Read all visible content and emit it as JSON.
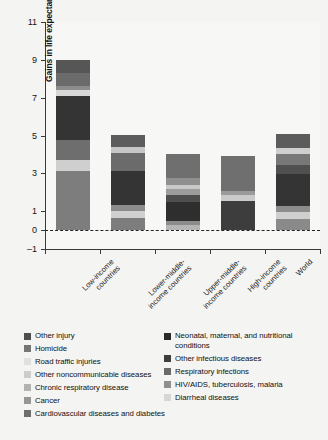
{
  "chart_data": {
    "type": "bar",
    "title": "",
    "subtitle": "",
    "xlabel": "",
    "ylabel": "Gains in life expectancy (years)",
    "ylim": [
      -1,
      11
    ],
    "yticks": [
      -1,
      0,
      1,
      3,
      5,
      7,
      9,
      11
    ],
    "ytick_labels": [
      "–1",
      "0",
      "1",
      "3",
      "5",
      "7",
      "9",
      "11"
    ],
    "grid": false,
    "stacked": true,
    "legend_position": "bottom",
    "zero_reference_line": true,
    "categories": [
      "Low-income countries",
      "Lower-middle-income countries",
      "Upper-middle-income countries",
      "High-income countries",
      "World"
    ],
    "category_labels": [
      [
        "Low-income",
        "countries"
      ],
      [
        "Lower-middle-",
        "income countries"
      ],
      [
        "Upper-middle-",
        "income countries"
      ],
      [
        "High-income",
        "countries"
      ],
      [
        "World"
      ]
    ],
    "series": [
      {
        "name": "Cardiovascular diseases and diabetes",
        "color": "#7d7d7d",
        "values": [
          3.15,
          0.62,
          0.3,
          0.0,
          0.62
        ]
      },
      {
        "name": "Cancer",
        "color": "#9a9a9a",
        "values": [
          0.0,
          0.32,
          0.22,
          0.0,
          0.23
        ]
      },
      {
        "name": "Chronic respiratory disease",
        "color": "#b4b4b4",
        "values": [
          0.0,
          0.1,
          0.1,
          0.0,
          0.1
        ]
      },
      {
        "name": "Other noncommunicable diseases",
        "color": "#cfcfcf",
        "values": [
          0.55,
          0.3,
          0.18,
          0.0,
          0.3
        ]
      },
      {
        "name": "Road traffic injuries",
        "color": "#e2e2e2",
        "values": [
          0.0,
          0.05,
          0.06,
          0.0,
          0.05
        ]
      },
      {
        "name": "Homicide",
        "color": "#6a6a6a",
        "values": [
          0.0,
          0.06,
          0.05,
          0.0,
          0.05
        ]
      },
      {
        "name": "Other injury",
        "color": "#565656",
        "values": [
          0.0,
          0.05,
          0.05,
          0.0,
          0.05
        ]
      },
      {
        "name": "Cardiovascular diseases and diabetes (dark)",
        "color": "#3a3a3a",
        "values": [
          3.2,
          1.72,
          1.05,
          2.1,
          1.7
        ]
      },
      {
        "name": "Other infectious diseases",
        "color": "#2b2b2b",
        "values": [
          0.0,
          0.0,
          0.3,
          0.0,
          0.2
        ]
      },
      {
        "name": "Respiratory infections",
        "color": "#707070",
        "values": [
          0.28,
          0.32,
          0.36,
          0.28,
          0.33
        ]
      },
      {
        "name": "HIV/AIDS, tuberculosis, malaria",
        "color": "#8c8c8c",
        "values": [
          0.22,
          0.22,
          0.22,
          0.22,
          0.22
        ]
      },
      {
        "name": "Diarrheal diseases",
        "color": "#d8d8d8",
        "values": [
          0.3,
          0.18,
          0.18,
          0.18,
          0.2
        ]
      },
      {
        "name": "Neonatal, maternal, and nutritional conditions",
        "color": "#4a4a4a",
        "values": [
          1.32,
          1.08,
          0.93,
          1.15,
          1.05
        ]
      }
    ],
    "totals": [
      9.02,
      5.02,
      4.0,
      3.93,
      5.1
    ]
  },
  "axis": {
    "y_label": "Gains in life expectancy (years)",
    "y_ticks": [
      {
        "value": 11,
        "label": "11"
      },
      {
        "value": 9,
        "label": "9"
      },
      {
        "value": 7,
        "label": "7"
      },
      {
        "value": 5,
        "label": "5"
      },
      {
        "value": 3,
        "label": "3"
      },
      {
        "value": 1,
        "label": "1"
      },
      {
        "value": 0,
        "label": "0"
      },
      {
        "value": -1,
        "label": "–1"
      }
    ]
  },
  "bars": [
    {
      "category": "Low-income countries",
      "label_line1": "Low-income",
      "label_line2": "countries",
      "total": 9.02,
      "segments": [
        {
          "name": "Cardiovascular diseases and diabetes",
          "value": 3.15,
          "color": "#7d7d7d"
        },
        {
          "name": "Other noncommunicable diseases",
          "value": 0.55,
          "color": "#cfcfcf"
        },
        {
          "name": "Cardiovascular + other",
          "value": 1.05,
          "color": "#6e6e6e"
        },
        {
          "name": "Neonatal, maternal, and nutritional conditions",
          "value": 2.35,
          "color": "#343434"
        },
        {
          "name": "Diarrheal diseases",
          "value": 0.3,
          "color": "#d8d8d8"
        },
        {
          "name": "HIV/AIDS, tuberculosis, malaria",
          "value": 0.22,
          "color": "#8c8c8c"
        },
        {
          "name": "Respiratory infections",
          "value": 0.7,
          "color": "#6b6b6b"
        },
        {
          "name": "Other injury",
          "value": 0.7,
          "color": "#565656"
        }
      ]
    },
    {
      "category": "Lower-middle-income countries",
      "label_line1": "Lower-middle-",
      "label_line2": "income countries",
      "total": 5.02,
      "segments": [
        {
          "name": "Cardiovascular diseases and diabetes",
          "value": 0.62,
          "color": "#7d7d7d"
        },
        {
          "name": "Diarrheal diseases",
          "value": 0.38,
          "color": "#d0d0d0"
        },
        {
          "name": "HIV/AIDS, tuberculosis, malaria",
          "value": 0.3,
          "color": "#8c8c8c"
        },
        {
          "name": "Neonatal, maternal, and nutritional conditions",
          "value": 1.8,
          "color": "#343434"
        },
        {
          "name": "Respiratory infections",
          "value": 0.95,
          "color": "#6b6b6b"
        },
        {
          "name": "Other noncommunicable diseases",
          "value": 0.35,
          "color": "#c6c6c6"
        },
        {
          "name": "Other injury",
          "value": 0.62,
          "color": "#5c5c5c"
        }
      ]
    },
    {
      "category": "Upper-middle-income countries",
      "label_line1": "Upper-middle-",
      "label_line2": "income countries",
      "total": 4.0,
      "segments": [
        {
          "name": "Diarrheal diseases",
          "value": 0.28,
          "color": "#b5b5b5"
        },
        {
          "name": "HIV/AIDS, tuberculosis, malaria",
          "value": 0.22,
          "color": "#8c8c8c"
        },
        {
          "name": "Neonatal, maternal, and nutritional conditions",
          "value": 1.0,
          "color": "#2e2e2e"
        },
        {
          "name": "Other infectious diseases",
          "value": 0.35,
          "color": "#4f4f4f"
        },
        {
          "name": "Respiratory infections",
          "value": 0.3,
          "color": "#9d9d9d"
        },
        {
          "name": "Other noncommunicable diseases",
          "value": 0.25,
          "color": "#c9c9c9"
        },
        {
          "name": "Cancer",
          "value": 0.35,
          "color": "#8f8f8f"
        },
        {
          "name": "Cardiovascular diseases and diabetes",
          "value": 1.25,
          "color": "#6f6f6f"
        }
      ]
    },
    {
      "category": "High-income countries",
      "label_line1": "High-income",
      "label_line2": "countries",
      "total": 3.93,
      "segments": [
        {
          "name": "Neonatal, maternal, and nutritional conditions",
          "value": 1.55,
          "color": "#3d3d3d"
        },
        {
          "name": "Diarrheal diseases",
          "value": 0.28,
          "color": "#cacaca"
        },
        {
          "name": "Respiratory infections",
          "value": 0.22,
          "color": "#9a9a9a"
        },
        {
          "name": "Cardiovascular diseases and diabetes",
          "value": 1.88,
          "color": "#6f6f6f"
        }
      ]
    },
    {
      "category": "World",
      "label_line1": "World",
      "label_line2": "",
      "total": 5.1,
      "segments": [
        {
          "name": "Cardiovascular diseases and diabetes",
          "value": 0.6,
          "color": "#8a8a8a"
        },
        {
          "name": "Diarrheal diseases",
          "value": 0.35,
          "color": "#cfcfcf"
        },
        {
          "name": "HIV/AIDS, tuberculosis, malaria",
          "value": 0.3,
          "color": "#8c8c8c"
        },
        {
          "name": "Neonatal, maternal, and nutritional conditions",
          "value": 1.7,
          "color": "#343434"
        },
        {
          "name": "Other infectious diseases",
          "value": 0.5,
          "color": "#505050"
        },
        {
          "name": "Respiratory infections",
          "value": 0.55,
          "color": "#787878"
        },
        {
          "name": "Other noncommunicable diseases",
          "value": 0.35,
          "color": "#cfcfcf"
        },
        {
          "name": "Other injury",
          "value": 0.75,
          "color": "#5c5c5c"
        }
      ]
    }
  ],
  "legend": {
    "left_column": [
      {
        "label": "Other injury",
        "color": "#4e4e4e"
      },
      {
        "label": "Homicide",
        "color": "#767676"
      },
      {
        "label": "Road traffic injuries",
        "color": "#e0e0e0"
      },
      {
        "label": "Other noncommunicable diseases",
        "color": "#cdcdcd"
      },
      {
        "label": "Chronic respiratory disease",
        "color": "#b2b2b2"
      },
      {
        "label": "Cancer",
        "color": "#969696"
      },
      {
        "label": "Cardiovascular diseases and diabetes",
        "color": "#6e6e6e"
      }
    ],
    "right_column": [
      {
        "label": "Neonatal, maternal, and nutritional conditions",
        "color": "#2a2a2a"
      },
      {
        "label": "Other infectious diseases",
        "color": "#3d3d3d"
      },
      {
        "label": "Respiratory infections",
        "color": "#6b6b6b"
      },
      {
        "label": "HIV/AIDS, tuberculosis, malaria",
        "color": "#8f8f8f"
      },
      {
        "label": "Diarrheal diseases",
        "color": "#d6d6d6"
      }
    ]
  }
}
